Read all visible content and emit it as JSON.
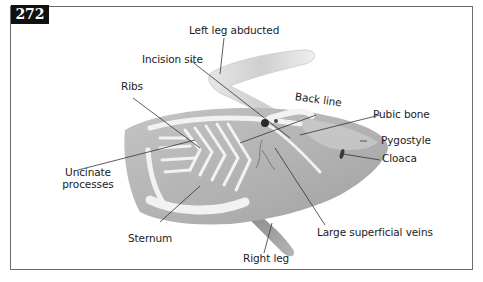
{
  "figure": {
    "number": "272"
  },
  "labels": {
    "left_leg": "Left leg abducted",
    "incision": "Incision site",
    "ribs": "Ribs",
    "back_line": "Back line",
    "pubic_bone": "Pubic bone",
    "pygostyle": "Pygostyle",
    "cloaca": "Cloaca",
    "uncinate_line1": "Uncinate",
    "uncinate_line2": "processes",
    "sternum": "Sternum",
    "veins": "Large superficial veins",
    "right_leg": "Right leg"
  },
  "colors": {
    "body": "#b4b4b4",
    "body_light": "#d2d2d2",
    "bone": "#f2f2f2",
    "leader": "#333333",
    "frame": "#6b6b6b"
  }
}
